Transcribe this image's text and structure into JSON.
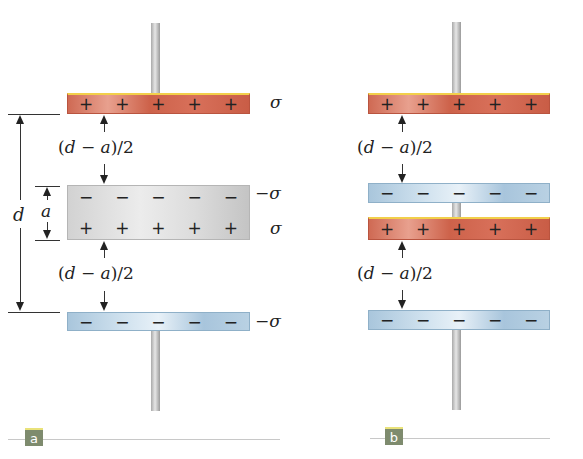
{
  "panels": [
    {
      "label": "a",
      "top_plate": {
        "charges": [
          "+",
          "+",
          "+",
          "+",
          "+"
        ],
        "density": "σ"
      },
      "slab": {
        "top_charges": [
          "−",
          "−",
          "−",
          "−",
          "−"
        ],
        "bottom_charges": [
          "+",
          "+",
          "+",
          "+",
          "+"
        ],
        "top_density": "−σ",
        "bottom_density": "σ"
      },
      "bottom_plate": {
        "charges": [
          "−",
          "−",
          "−",
          "−",
          "−"
        ],
        "density": "−σ"
      },
      "gap_label_top": {
        "open": "(",
        "d": "d",
        "minus": " − ",
        "a": "a",
        "close": ")/2"
      },
      "gap_label_bottom": {
        "open": "(",
        "d": "d",
        "minus": " − ",
        "a": "a",
        "close": ")/2"
      },
      "dimension_d": "d",
      "dimension_a": "a"
    },
    {
      "label": "b",
      "plates": [
        {
          "type": "positive",
          "charges": [
            "+",
            "+",
            "+",
            "+",
            "+"
          ]
        },
        {
          "type": "negative",
          "charges": [
            "−",
            "−",
            "−",
            "−",
            "−"
          ]
        },
        {
          "type": "positive",
          "charges": [
            "+",
            "+",
            "+",
            "+",
            "+"
          ]
        },
        {
          "type": "negative",
          "charges": [
            "−",
            "−",
            "−",
            "−",
            "−"
          ]
        }
      ],
      "gap_label_top": {
        "open": "(",
        "d": "d",
        "minus": " − ",
        "a": "a",
        "close": ")/2"
      },
      "gap_label_bottom": {
        "open": "(",
        "d": "d",
        "minus": " − ",
        "a": "a",
        "close": ")/2"
      }
    }
  ],
  "colors": {
    "positive_plate": "#d0654e",
    "negative_plate": "#b3cee2",
    "dielectric_slab": "#dcdcdc",
    "plate_top_edge": "#f2cf4a",
    "tag_background": "#7e8b6e"
  }
}
